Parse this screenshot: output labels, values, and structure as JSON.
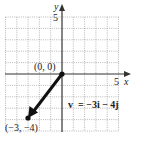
{
  "chart_data": {
    "type": "vector-plot",
    "title": "",
    "xlabel": "x",
    "ylabel": "y",
    "xlim": [
      -5,
      5
    ],
    "ylim": [
      -5,
      5
    ],
    "grid": true,
    "x_tick_labels": [
      {
        "value": 5,
        "label": "5"
      }
    ],
    "y_tick_labels": [
      {
        "value": 5,
        "label": "5"
      }
    ],
    "vector": {
      "tail": [
        0,
        0
      ],
      "head": [
        -3,
        -4
      ],
      "label": "v = −3i − 4j"
    },
    "points": [
      {
        "x": 0,
        "y": 0,
        "label": "(0, 0)"
      },
      {
        "x": -3,
        "y": -4,
        "label": "(−3, −4)"
      }
    ]
  },
  "labels": {
    "x_axis": "x",
    "y_axis": "y",
    "x_tick": "5",
    "y_tick": "5",
    "origin": "(0, 0)",
    "endpoint": "(−3, −4)",
    "vector_v": "v",
    "vector_eq": "= −3i − 4j"
  },
  "colors": {
    "axis": "#333333",
    "grid": "#9a9a9a",
    "vector": "#111111"
  }
}
